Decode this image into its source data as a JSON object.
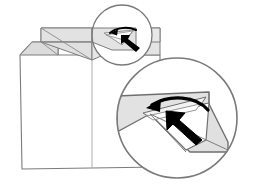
{
  "figure": {
    "kind": "origami-fold-instruction-diagram",
    "canvas": {
      "width": 253,
      "height": 188
    },
    "background_color": "#ffffff"
  },
  "palette": {
    "outline": "#6f6f6f",
    "outline_dark": "#4a4a4a",
    "paper_white": "#ffffff",
    "paper_shade_light": "#ececec",
    "paper_shade_mid": "#e0e0e0",
    "paper_shade_dark": "#cfcfcf",
    "arrow_fill": "#000000",
    "magnifier_ring": "#7a7a7a"
  },
  "main_figure": {
    "name": "paper-shirt",
    "body": {
      "name": "shirt-body-panel",
      "fill": "#ffffff",
      "description": "large white rectangular body panel with clipped left shoulder corner"
    },
    "center_crease": {
      "name": "vertical-center-crease",
      "description": "vertical fold line running down the middle of the body"
    },
    "collar_band": {
      "name": "collar-band",
      "fill": "#e6e6e6",
      "description": "horizontal shaded band across the top forming the collar"
    },
    "collar_left_flap": {
      "name": "collar-left-flap",
      "fill": "#dedede",
      "description": "left triangular collar point angling down to the center"
    },
    "collar_right_flap": {
      "name": "collar-right-flap",
      "fill": "#e2e2e2",
      "description": "right triangular collar point angling down to the center"
    },
    "left_shoulder_flap": {
      "name": "left-shoulder-flap",
      "fill": "#dcdcdc",
      "description": "small shaded sleeve/shoulder wedge at the far left"
    },
    "right_shoulder_flap": {
      "name": "right-shoulder-flap",
      "fill": "#e2e2e2",
      "description": "small shaded sleeve/shoulder wedge at the far right"
    }
  },
  "callouts": [
    {
      "name": "magnifier-small",
      "role": "detail-circle-source",
      "center": {
        "x": 122,
        "y": 35
      },
      "radius": 30,
      "ring_color": "#7a7a7a",
      "contents": "close-up of the collar tip being tucked"
    },
    {
      "name": "magnifier-large",
      "role": "detail-circle-zoom",
      "center": {
        "x": 177,
        "y": 118
      },
      "radius": 60,
      "ring_color": "#7a7a7a",
      "contents": "enlarged view of the collar tip with fold and push arrows"
    }
  ],
  "arrows": [
    {
      "name": "fold-arrow-small",
      "style": "curved-open",
      "direction": "left",
      "color": "#000000",
      "location": "magnifier-small",
      "meaning": "fold the flap over toward the left"
    },
    {
      "name": "push-arrow-small",
      "style": "solid-block",
      "direction": "up-left",
      "color": "#000000",
      "location": "magnifier-small",
      "meaning": "push here to tuck the paper inside"
    },
    {
      "name": "fold-arrow-large",
      "style": "curved-open",
      "direction": "left",
      "color": "#000000",
      "location": "magnifier-large",
      "meaning": "fold the flap over toward the left"
    },
    {
      "name": "push-arrow-large",
      "style": "solid-block",
      "direction": "up-left",
      "color": "#000000",
      "location": "magnifier-large",
      "meaning": "push here to tuck the paper inside"
    }
  ],
  "labels": {
    "visible_text": []
  }
}
